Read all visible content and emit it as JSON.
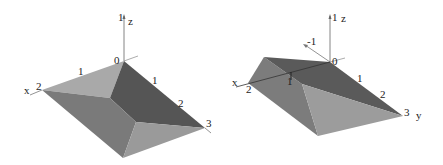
{
  "figures": [
    {
      "id": "left",
      "axis_labels": {
        "x": "x",
        "z": "z"
      },
      "ticks": {
        "z_top": "1",
        "origin": "0",
        "x_edge_1": "1",
        "x_end": "2",
        "y_edge_1": "1",
        "y_edge_2": "2",
        "y_end": "3"
      },
      "face_colors": {
        "top_light": "#a9a9a9",
        "back_dark": "#555555",
        "front_left": "#7a7a7a",
        "front_right": "#9a9a9a"
      }
    },
    {
      "id": "right",
      "axis_labels": {
        "x": "x",
        "y": "y",
        "z": "z"
      },
      "ticks": {
        "z_top": "1",
        "neg": "-1",
        "origin": "0",
        "x_mid": "1",
        "x_end": "2",
        "y_edge_1": "1",
        "y_edge_2": "2",
        "y_end": "3"
      },
      "face_colors": {
        "top_dark": "#5a5a5a",
        "front_light": "#9c9c9c",
        "left_mid": "#7c7c7c"
      }
    }
  ]
}
